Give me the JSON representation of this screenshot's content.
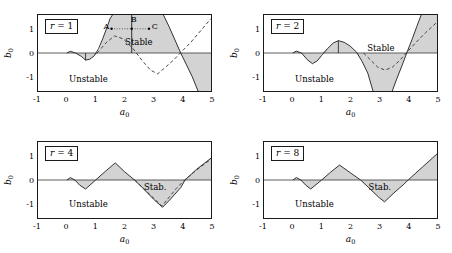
{
  "figure": {
    "axis_x_label": "a",
    "axis_x_sub": "0",
    "axis_y_label": "b",
    "axis_y_sub": "0",
    "xticks": [
      "-1",
      "0",
      "1",
      "2",
      "3",
      "4",
      "5"
    ],
    "yticks": [
      "1",
      "0",
      "-1"
    ],
    "stable_label": "Stable",
    "stable_label_short": "Stab.",
    "unstable_label": "Unstable",
    "point_labels": [
      "A",
      "B",
      "C"
    ]
  },
  "chart_data": {
    "type": "line",
    "title": "",
    "xlabel": "a_0",
    "ylabel": "b_0",
    "xlim": [
      -1,
      5
    ],
    "ylim": [
      -1.6,
      1.6
    ],
    "grid": false,
    "legend": "none",
    "panels": [
      {
        "id": "r1",
        "label_prefix": "r",
        "label_eq": " = ",
        "label_value": "1",
        "region_stable": "Stable",
        "region_unstable": "Unstable",
        "boundary_solid": [
          [
            0.0,
            0.0
          ],
          [
            0.12,
            0.07
          ],
          [
            0.3,
            0.0
          ],
          [
            0.5,
            -0.14
          ],
          [
            0.65,
            -0.3
          ],
          [
            0.8,
            -0.26
          ],
          [
            0.95,
            -0.12
          ],
          [
            1.1,
            0.18
          ],
          [
            1.25,
            0.62
          ],
          [
            1.4,
            1.1
          ],
          [
            1.5,
            1.45
          ],
          [
            1.58,
            1.6
          ]
        ],
        "boundary_solid_right": [
          [
            3.35,
            1.6
          ],
          [
            3.55,
            1.1
          ],
          [
            3.75,
            0.55
          ],
          [
            3.95,
            0.0
          ],
          [
            4.15,
            -0.5
          ],
          [
            4.35,
            -1.0
          ],
          [
            4.55,
            -1.6
          ]
        ],
        "vertical_segment": {
          "x": 2.25,
          "y0": 0.0,
          "y1": 1.6
        },
        "vertical_tick": {
          "x": 0.65,
          "y0": 0.0,
          "y1": -0.3
        },
        "fill_upper": [
          [
            1.1,
            0.0
          ],
          [
            1.25,
            0.62
          ],
          [
            1.4,
            1.1
          ],
          [
            1.5,
            1.45
          ],
          [
            1.58,
            1.6
          ],
          [
            3.35,
            1.6
          ],
          [
            3.55,
            1.1
          ],
          [
            3.75,
            0.55
          ],
          [
            3.95,
            0.0
          ]
        ],
        "fill_lower_left": [
          [
            0.0,
            0.0
          ],
          [
            0.12,
            0.07
          ],
          [
            0.3,
            0.0
          ],
          [
            0.5,
            -0.14
          ],
          [
            0.65,
            -0.3
          ],
          [
            0.8,
            -0.26
          ],
          [
            0.95,
            -0.12
          ],
          [
            1.1,
            0.0
          ]
        ],
        "fill_lower_right": [
          [
            3.95,
            0.0
          ],
          [
            4.15,
            -0.5
          ],
          [
            4.35,
            -1.0
          ],
          [
            4.55,
            -1.6
          ],
          [
            5.0,
            -1.6
          ],
          [
            5.0,
            0.0
          ]
        ],
        "dashed": [
          [
            1.05,
            0.0
          ],
          [
            1.35,
            0.42
          ],
          [
            1.65,
            0.72
          ],
          [
            1.95,
            0.6
          ],
          [
            2.3,
            0.18
          ],
          [
            2.6,
            -0.3
          ],
          [
            2.9,
            -0.72
          ],
          [
            3.15,
            -0.88
          ],
          [
            3.4,
            -0.62
          ],
          [
            3.7,
            -0.3
          ],
          [
            3.95,
            0.02
          ],
          [
            4.3,
            0.45
          ],
          [
            4.65,
            0.95
          ],
          [
            5.0,
            1.45
          ]
        ],
        "points": [
          {
            "name": "A",
            "x": 1.55,
            "y": 1.02
          },
          {
            "name": "B",
            "x": 2.25,
            "y": 1.02
          },
          {
            "name": "C",
            "x": 2.85,
            "y": 1.02
          }
        ],
        "point_connector": {
          "from": [
            1.55,
            1.02
          ],
          "to": [
            2.85,
            1.02
          ]
        },
        "stable_text_at": [
          2.5,
          0.45
        ],
        "unstable_text_at": [
          0.1,
          -1.05
        ]
      },
      {
        "id": "r2",
        "label_prefix": "r",
        "label_eq": " = ",
        "label_value": "2",
        "region_stable": "Stable",
        "region_unstable": "Unstable",
        "boundary_solid": [
          [
            0.0,
            0.0
          ],
          [
            0.12,
            0.08
          ],
          [
            0.3,
            0.0
          ],
          [
            0.5,
            -0.28
          ],
          [
            0.68,
            -0.45
          ],
          [
            0.85,
            -0.33
          ],
          [
            1.0,
            -0.1
          ],
          [
            1.2,
            0.18
          ],
          [
            1.4,
            0.42
          ],
          [
            1.58,
            0.52
          ],
          [
            1.78,
            0.45
          ],
          [
            1.98,
            0.3
          ],
          [
            2.2,
            0.05
          ],
          [
            2.4,
            -0.35
          ],
          [
            2.6,
            -0.85
          ],
          [
            2.78,
            -1.6
          ]
        ],
        "boundary_solid_right": [
          [
            3.45,
            -1.6
          ],
          [
            3.6,
            -1.1
          ],
          [
            3.78,
            -0.55
          ],
          [
            3.95,
            0.0
          ],
          [
            4.15,
            0.62
          ],
          [
            4.3,
            1.12
          ],
          [
            4.45,
            1.6
          ]
        ],
        "vertical_tick": {
          "x": 1.58,
          "y0": 0.0,
          "y1": 0.52
        },
        "fill_upper": [
          [
            1.0,
            0.0
          ],
          [
            1.2,
            0.18
          ],
          [
            1.4,
            0.42
          ],
          [
            1.58,
            0.52
          ],
          [
            1.78,
            0.45
          ],
          [
            1.98,
            0.3
          ],
          [
            2.2,
            0.05
          ],
          [
            2.2,
            0.0
          ]
        ],
        "fill_lower_left": [
          [
            0.0,
            0.0
          ],
          [
            0.12,
            0.08
          ],
          [
            0.3,
            0.0
          ],
          [
            0.5,
            -0.28
          ],
          [
            0.68,
            -0.45
          ],
          [
            0.85,
            -0.33
          ],
          [
            1.0,
            -0.1
          ],
          [
            1.0,
            0.0
          ]
        ],
        "fill_lower_mid": [
          [
            2.2,
            0.0
          ],
          [
            2.4,
            -0.35
          ],
          [
            2.6,
            -0.85
          ],
          [
            2.78,
            -1.6
          ],
          [
            3.45,
            -1.6
          ],
          [
            3.6,
            -1.1
          ],
          [
            3.78,
            -0.55
          ],
          [
            3.95,
            0.0
          ]
        ],
        "fill_upper_right": [
          [
            3.95,
            0.0
          ],
          [
            4.15,
            0.62
          ],
          [
            4.3,
            1.12
          ],
          [
            4.45,
            1.6
          ],
          [
            5.0,
            1.6
          ],
          [
            5.0,
            0.0
          ]
        ],
        "dashed": [
          [
            2.45,
            0.0
          ],
          [
            2.7,
            -0.3
          ],
          [
            2.95,
            -0.6
          ],
          [
            3.2,
            -0.72
          ],
          [
            3.45,
            -0.6
          ],
          [
            3.7,
            -0.32
          ],
          [
            3.95,
            0.02
          ],
          [
            4.25,
            0.42
          ],
          [
            4.6,
            0.85
          ],
          [
            5.0,
            1.3
          ]
        ],
        "stable_text_at": [
          3.05,
          0.2
        ],
        "unstable_text_at": [
          0.1,
          -1.05
        ]
      },
      {
        "id": "r4",
        "label_prefix": "r",
        "label_eq": " = ",
        "label_value": "4",
        "region_stable": "Stab.",
        "region_unstable": "Unstable",
        "boundary_solid": [
          [
            0.0,
            0.0
          ],
          [
            0.12,
            0.1
          ],
          [
            0.28,
            0.0
          ],
          [
            0.45,
            -0.22
          ],
          [
            0.65,
            -0.38
          ],
          [
            1.0,
            0.0
          ],
          [
            1.35,
            0.38
          ],
          [
            1.68,
            0.72
          ],
          [
            2.0,
            0.35
          ],
          [
            2.35,
            0.0
          ],
          [
            2.7,
            -0.42
          ],
          [
            3.0,
            -0.8
          ],
          [
            3.32,
            -1.15
          ],
          [
            3.6,
            -0.8
          ],
          [
            3.95,
            -0.32
          ],
          [
            4.1,
            0.0
          ],
          [
            4.5,
            0.45
          ],
          [
            5.0,
            0.92
          ]
        ],
        "fill_upper_1": [
          [
            1.0,
            0.0
          ],
          [
            1.35,
            0.38
          ],
          [
            1.68,
            0.72
          ],
          [
            2.0,
            0.35
          ],
          [
            2.35,
            0.0
          ]
        ],
        "fill_lower_1": [
          [
            0.0,
            0.0
          ],
          [
            0.12,
            0.1
          ],
          [
            0.28,
            0.0
          ],
          [
            0.45,
            -0.22
          ],
          [
            0.65,
            -0.38
          ],
          [
            1.0,
            0.0
          ]
        ],
        "fill_lower_2": [
          [
            2.35,
            0.0
          ],
          [
            2.7,
            -0.42
          ],
          [
            3.0,
            -0.8
          ],
          [
            3.32,
            -1.15
          ],
          [
            3.6,
            -0.8
          ],
          [
            3.95,
            -0.32
          ],
          [
            4.1,
            0.0
          ]
        ],
        "fill_upper_2": [
          [
            4.1,
            0.0
          ],
          [
            4.5,
            0.45
          ],
          [
            5.0,
            0.92
          ],
          [
            5.0,
            0.0
          ]
        ],
        "dashed": [
          [
            2.35,
            0.0
          ],
          [
            2.7,
            -0.4
          ],
          [
            3.0,
            -0.75
          ],
          [
            3.3,
            -1.1
          ],
          [
            3.55,
            -0.72
          ],
          [
            3.8,
            -0.35
          ],
          [
            4.1,
            0.02
          ],
          [
            4.5,
            0.42
          ],
          [
            5.0,
            0.88
          ]
        ],
        "stable_text_at": [
          3.15,
          -0.28
        ],
        "unstable_text_at": [
          0.1,
          -1.0
        ]
      },
      {
        "id": "r8",
        "label_prefix": "r",
        "label_eq": " = ",
        "label_value": "8",
        "region_stable": "Stab.",
        "region_unstable": "Unstable",
        "boundary_solid": [
          [
            0.0,
            0.0
          ],
          [
            0.12,
            0.1
          ],
          [
            0.28,
            0.0
          ],
          [
            0.45,
            -0.22
          ],
          [
            0.62,
            -0.38
          ],
          [
            1.0,
            0.0
          ],
          [
            1.3,
            0.32
          ],
          [
            1.62,
            0.63
          ],
          [
            2.0,
            0.3
          ],
          [
            2.35,
            0.0
          ],
          [
            2.7,
            -0.4
          ],
          [
            3.0,
            -0.75
          ],
          [
            3.18,
            -0.92
          ],
          [
            3.5,
            -0.55
          ],
          [
            3.85,
            -0.18
          ],
          [
            4.0,
            0.0
          ],
          [
            4.5,
            0.55
          ],
          [
            5.0,
            1.1
          ]
        ],
        "fill_upper_1": [
          [
            1.0,
            0.0
          ],
          [
            1.3,
            0.32
          ],
          [
            1.62,
            0.63
          ],
          [
            2.0,
            0.3
          ],
          [
            2.35,
            0.0
          ]
        ],
        "fill_lower_1": [
          [
            0.0,
            0.0
          ],
          [
            0.12,
            0.1
          ],
          [
            0.28,
            0.0
          ],
          [
            0.45,
            -0.22
          ],
          [
            0.62,
            -0.38
          ],
          [
            1.0,
            0.0
          ]
        ],
        "fill_lower_2": [
          [
            2.35,
            0.0
          ],
          [
            2.7,
            -0.4
          ],
          [
            3.0,
            -0.75
          ],
          [
            3.18,
            -0.92
          ],
          [
            3.5,
            -0.55
          ],
          [
            3.85,
            -0.18
          ],
          [
            4.0,
            0.0
          ]
        ],
        "fill_upper_2": [
          [
            4.0,
            0.0
          ],
          [
            4.5,
            0.55
          ],
          [
            5.0,
            1.1
          ],
          [
            5.0,
            0.0
          ]
        ],
        "dashed": [],
        "stable_text_at": [
          3.1,
          -0.3
        ],
        "unstable_text_at": [
          0.1,
          -1.0
        ]
      }
    ]
  },
  "style": {
    "fill_color": "#d3d3d3",
    "line_color": "#1a1a1a",
    "axis_color": "#555555",
    "background": "#ffffff"
  }
}
